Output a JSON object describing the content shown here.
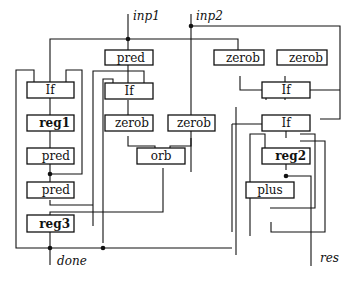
{
  "diagram": {
    "title": "",
    "ports": {
      "inp1": "inp1",
      "inp2": "inp2",
      "done": "done",
      "res": "res"
    },
    "boxes": [
      {
        "id": "pred-top",
        "label": "pred",
        "bold": false
      },
      {
        "id": "zerob-r1",
        "label": "zerob",
        "bold": false
      },
      {
        "id": "zerob-r2",
        "label": "zerob",
        "bold": false
      },
      {
        "id": "if-left",
        "label": "If",
        "bold": false
      },
      {
        "id": "if-mid",
        "label": "If",
        "bold": false
      },
      {
        "id": "if-right-top",
        "label": "If",
        "bold": false
      },
      {
        "id": "reg1",
        "label": "reg1",
        "bold": true
      },
      {
        "id": "zerob-m1",
        "label": "zerob",
        "bold": false
      },
      {
        "id": "zerob-m2",
        "label": "zerob",
        "bold": false
      },
      {
        "id": "if-right-2",
        "label": "If",
        "bold": false
      },
      {
        "id": "pred-left-1",
        "label": "pred",
        "bold": false
      },
      {
        "id": "orb",
        "label": "orb",
        "bold": false
      },
      {
        "id": "reg2",
        "label": "reg2",
        "bold": true
      },
      {
        "id": "pred-left-2",
        "label": "pred",
        "bold": false
      },
      {
        "id": "plus",
        "label": "plus",
        "bold": false
      },
      {
        "id": "reg3",
        "label": "reg3",
        "bold": true
      }
    ]
  }
}
